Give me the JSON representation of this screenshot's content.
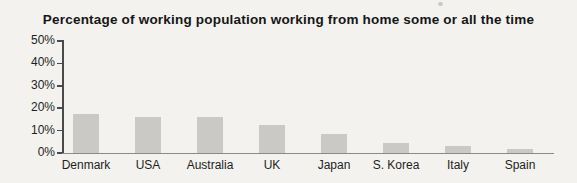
{
  "title": "Percentage of working population working from home some or all the time",
  "chart_data": {
    "type": "bar",
    "title": "Percentage of working population working from home some or all the time",
    "categories": [
      "Denmark",
      "USA",
      "Australia",
      "UK",
      "Japan",
      "S. Korea",
      "Italy",
      "Spain"
    ],
    "values": [
      17.5,
      16,
      16,
      12.5,
      8.5,
      4.5,
      3,
      2
    ],
    "xlabel": "",
    "ylabel": "",
    "ylim": [
      0,
      50
    ],
    "yticks": [
      0,
      10,
      20,
      30,
      40,
      50
    ],
    "ytick_labels": [
      "0%",
      "10%",
      "20%",
      "30%",
      "40%",
      "50%"
    ],
    "grid": false,
    "legend": false,
    "bar_color": "#cac9c6",
    "background_color": "#f3f2ee",
    "axis_color": "#4a4a4a"
  }
}
